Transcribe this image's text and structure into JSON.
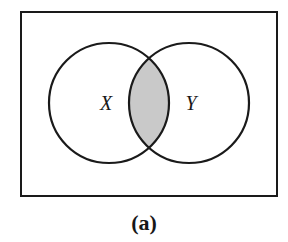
{
  "figure": {
    "caption": "(a)",
    "background_color": "#ffffff",
    "stroke_color": "#1a1a1a",
    "universe": {
      "label": "",
      "shape": "rectangle",
      "x": 21,
      "y": 12,
      "width": 256,
      "height": 184,
      "border_width": 2,
      "fill": "#ffffff"
    },
    "sets": [
      {
        "name": "X",
        "label": "X",
        "cx": 109,
        "cy": 103,
        "r": 60,
        "label_x": 106,
        "label_y": 103,
        "fill": "#ffffff",
        "stroke": "#1a1a1a",
        "stroke_width": 2.2
      },
      {
        "name": "Y",
        "label": "Y",
        "cx": 189,
        "cy": 103,
        "r": 60,
        "label_x": 191,
        "label_y": 103,
        "fill": "#ffffff",
        "stroke": "#1a1a1a",
        "stroke_width": 2.2
      }
    ],
    "shaded_region": {
      "name": "intersection",
      "description": "X intersect Y",
      "fill": "#c9c9c9",
      "stroke": "#1a1a1a",
      "stroke_width": 2.2,
      "top_crossing_x": 152,
      "top_crossing_y": 62,
      "bottom_crossing_x": 152,
      "bottom_crossing_y": 145
    },
    "label_font_size": 20,
    "caption_font_size": 22,
    "caption_x": 144,
    "caption_y": 230
  }
}
